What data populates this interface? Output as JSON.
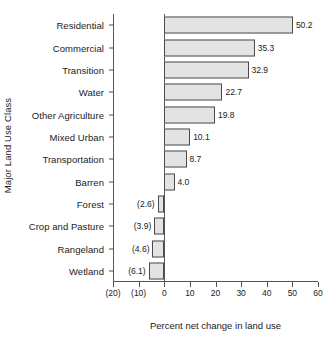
{
  "chart_data": {
    "type": "bar",
    "orientation": "horizontal",
    "title": "",
    "xlabel": "Percent net change in land use",
    "ylabel": "Major Land Use Class",
    "categories": [
      "Residential",
      "Commercial",
      "Transition",
      "Water",
      "Other Agriculture",
      "Mixed Urban",
      "Transportation",
      "Barren",
      "Forest",
      "Crop and Pasture",
      "Rangeland",
      "Wetland"
    ],
    "values": [
      50.2,
      35.3,
      32.9,
      22.7,
      19.8,
      10.1,
      8.7,
      4.0,
      -2.6,
      -3.9,
      -4.6,
      -6.1
    ],
    "value_labels": [
      "50.2",
      "35.3",
      "32.9",
      "22.7",
      "19.8",
      "10.1",
      "8.7",
      "4.0",
      "(2.6)",
      "(3.9)",
      "(4.6)",
      "(6.1)"
    ],
    "xlim": [
      -20,
      60
    ],
    "xticks": [
      -20,
      -10,
      0,
      10,
      20,
      30,
      40,
      50,
      60
    ],
    "xtick_labels": [
      "(20)",
      "(10)",
      "0",
      "10",
      "20",
      "30",
      "40",
      "50",
      "60"
    ],
    "grid": false,
    "legend": false,
    "bar_fill_color": "#e3e3e3",
    "bar_border_color": "#4a4a4a",
    "axis_color": "#555555",
    "text_color": "#1a1a1a"
  }
}
